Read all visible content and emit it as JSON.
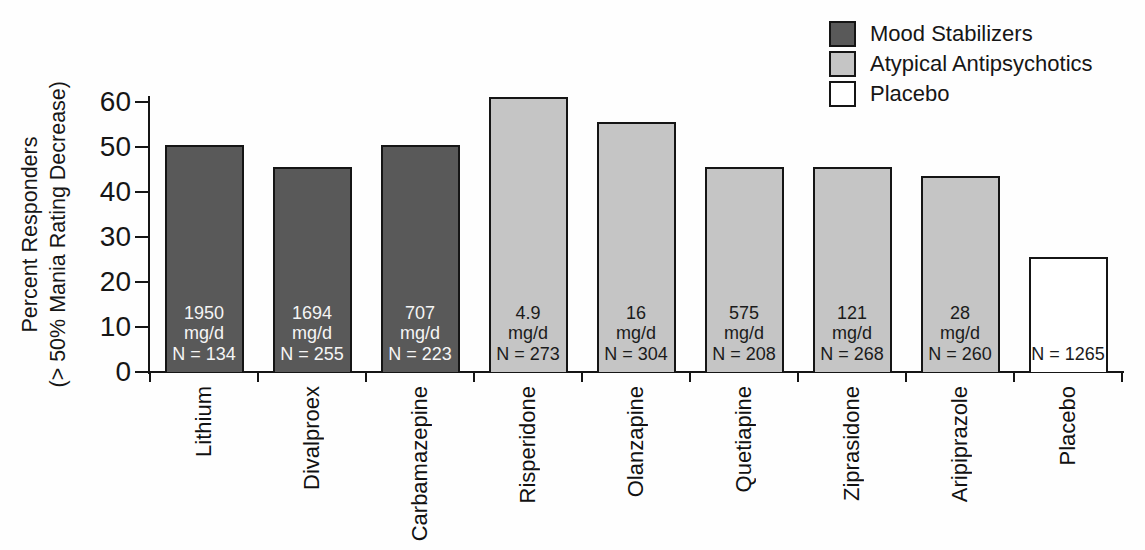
{
  "chart_data": {
    "type": "bar",
    "title": "",
    "ylabel_line1": "Percent Responders",
    "ylabel_line2": "(> 50% Mania Rating Decrease)",
    "ylim": [
      0,
      62
    ],
    "yticks": [
      0,
      10,
      20,
      30,
      40,
      50,
      60
    ],
    "grid": false,
    "legend_position": "top-right",
    "colors": {
      "mood_stabilizers": "#595959",
      "atypical_antipsychotics": "#c5c5c5",
      "placebo": "#ffffff"
    },
    "legend": [
      {
        "label": "Mood Stabilizers",
        "color": "#595959"
      },
      {
        "label": "Atypical Antipsychotics",
        "color": "#c5c5c5"
      },
      {
        "label": "Placebo",
        "color": "#ffffff"
      }
    ],
    "bars": [
      {
        "label": "Lithium",
        "value": 50.5,
        "dose": "1950",
        "unit": "mg/d",
        "n_label": "N = 134",
        "group": "mood_stabilizers"
      },
      {
        "label": "Divalproex",
        "value": 45.5,
        "dose": "1694",
        "unit": "mg/d",
        "n_label": "N = 255",
        "group": "mood_stabilizers"
      },
      {
        "label": "Carbamazepine",
        "value": 50.5,
        "dose": "707",
        "unit": "mg/d",
        "n_label": "N = 223",
        "group": "mood_stabilizers"
      },
      {
        "label": "Risperidone",
        "value": 61,
        "dose": "4.9",
        "unit": "mg/d",
        "n_label": "N = 273",
        "group": "atypical_antipsychotics"
      },
      {
        "label": "Olanzapine",
        "value": 55.5,
        "dose": "16",
        "unit": "mg/d",
        "n_label": "N = 304",
        "group": "atypical_antipsychotics"
      },
      {
        "label": "Quetiapine",
        "value": 45.5,
        "dose": "575",
        "unit": "mg/d",
        "n_label": "N = 208",
        "group": "atypical_antipsychotics"
      },
      {
        "label": "Ziprasidone",
        "value": 45.5,
        "dose": "121",
        "unit": "mg/d",
        "n_label": "N = 268",
        "group": "atypical_antipsychotics"
      },
      {
        "label": "Aripiprazole",
        "value": 43.5,
        "dose": "28",
        "unit": "mg/d",
        "n_label": "N = 260",
        "group": "atypical_antipsychotics"
      },
      {
        "label": "Placebo",
        "value": 25.5,
        "dose": null,
        "unit": null,
        "n_label": "N = 1265",
        "group": "placebo"
      }
    ]
  }
}
